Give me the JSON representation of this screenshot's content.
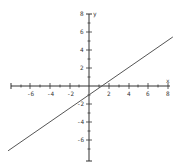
{
  "chart_data": {
    "type": "line",
    "title": "",
    "xlabel": "x",
    "ylabel": "y",
    "xlim": [
      -8.3,
      8.6
    ],
    "ylim": [
      -8,
      8
    ],
    "grid": false,
    "x_ticks": [
      -6,
      -4,
      -2,
      2,
      4,
      6,
      8
    ],
    "y_ticks": [
      8,
      6,
      4,
      2,
      -2,
      -4,
      -6
    ],
    "series": [
      {
        "name": "y = 0.75x - 1",
        "x": [
          -8.3,
          8.6
        ],
        "y": [
          -7.2,
          5.45
        ],
        "slope": 0.75,
        "intercept": -1
      }
    ],
    "colors": {
      "axis": "#333333",
      "line": "#555555"
    }
  },
  "labels": {
    "x_axis": "x",
    "y_axis": "y",
    "xt": [
      "-6",
      "-4",
      "-2",
      "2",
      "4",
      "6",
      "8"
    ],
    "yt": [
      "8",
      "6",
      "4",
      "2",
      "-2",
      "-4",
      "-6"
    ]
  }
}
